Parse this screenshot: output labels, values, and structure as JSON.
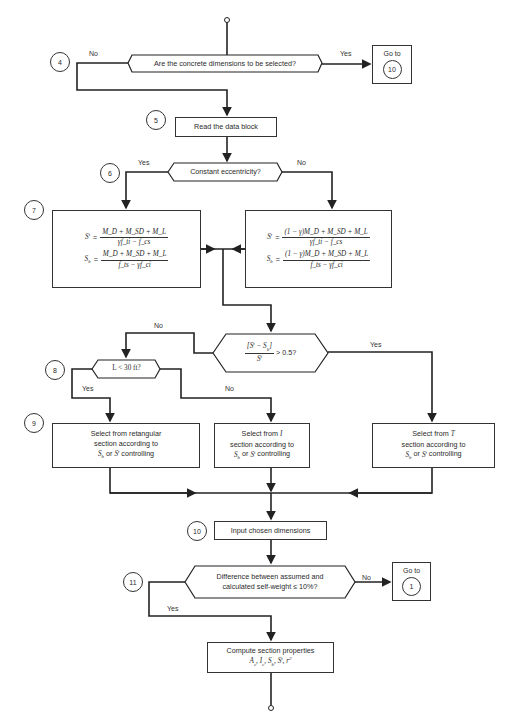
{
  "flowchart": {
    "nodes": {
      "d_select": {
        "text": "Are the concrete dimensions to be selected?",
        "yes": "Yes",
        "no": "No",
        "step": "4"
      },
      "goto_10": {
        "label": "Go to",
        "target": "10"
      },
      "read_data": {
        "text": "Read the data block",
        "step": "5"
      },
      "d_ecc": {
        "text": "Constant eccentricity?",
        "yes": "Yes",
        "no": "No",
        "step": "6"
      },
      "eq_const": {
        "step": "7",
        "st_lhs": "S",
        "st_sup": "t",
        "st_num": "M_D + M_SD + M_L",
        "st_den": "γf_ti − f_cs",
        "sb_lhs": "S",
        "sb_sub": "b",
        "sb_num": "M_D + M_SD + M_L",
        "sb_den": "f_ts − γf_ci"
      },
      "eq_var": {
        "st_num": "(1 − γ)M_D + M_SD + M_L",
        "st_den": "γf_ti − f_cs",
        "sb_num": "(1 − γ)M_D + M_SD + M_L",
        "sb_den": "f_ts − γf_ci"
      },
      "d_ratio": {
        "text": "[S^t − S_b] / S^t > 0.5?",
        "gt": "> 0.5?",
        "yes": "Yes",
        "no": "No"
      },
      "d_span": {
        "text": "L < 30 ft?",
        "yes": "Yes",
        "no": "No",
        "step": "8"
      },
      "sel_rect": {
        "line1": "Select from retangular",
        "line2": "section according to",
        "line3": "or",
        "line3b": "controlling",
        "step": "9"
      },
      "sel_i": {
        "line1a": "Select from",
        "line1b": "I",
        "line2": "section according to",
        "line3": "or",
        "line3b": "controlling"
      },
      "sel_t": {
        "line1a": "Select from",
        "line1b": "T",
        "line2": "section according to",
        "line3": "or",
        "line3b": "controlling"
      },
      "input_dims": {
        "text": "Input chosen dimensions",
        "step": "10"
      },
      "d_weight": {
        "line1": "Difference between assumed and",
        "line2": "calculated self-weight ≤ 10%?",
        "yes": "Yes",
        "no": "No",
        "step": "11"
      },
      "goto_1": {
        "label": "Go to",
        "target": "1"
      },
      "compute": {
        "line1": "Compute section properties",
        "line2": "A_c, I_c, S_b, S^t, r^2"
      }
    }
  }
}
